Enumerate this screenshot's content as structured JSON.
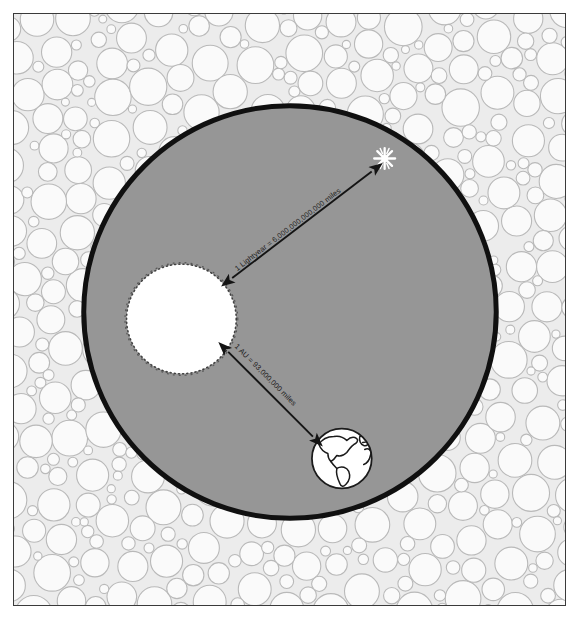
{
  "figure": {
    "background_texture": "pebble-bubble-pattern",
    "frame_color": "#3a3a3a",
    "space_disc_color": "#969696",
    "space_disc_outline_color": "#111111",
    "page_background": "#ffffff"
  },
  "objects": {
    "sun": {
      "name": "Sun",
      "fill_color": "#ffffff",
      "edge_style": "rough-stippled",
      "center_x": 181,
      "center_y": 319,
      "radius": 55
    },
    "earth": {
      "name": "Earth",
      "fill_color": "#ffffff",
      "outline_color": "#1b1b1b",
      "center_x": 342,
      "center_y": 459,
      "radius": 31,
      "visible_continents": "Americas"
    },
    "star": {
      "name": "Star",
      "glyph": "starburst-sparkle",
      "fill_color": "#ffffff",
      "center_x": 385,
      "center_y": 158,
      "radius": 11
    }
  },
  "measurements": [
    {
      "id": "lightyear",
      "label": "1 Lightyear = 6,000,000,000,000 miles",
      "from": "sun",
      "to": "star",
      "arrow_style": "double-headed",
      "x1": 232,
      "y1": 278,
      "x2": 372,
      "y2": 171
    },
    {
      "id": "astronomical-unit",
      "label": "1 AU = 93,000,000 miles",
      "from": "sun",
      "to": "earth",
      "arrow_style": "double-headed",
      "x1": 228,
      "y1": 352,
      "x2": 313,
      "y2": 437
    }
  ]
}
